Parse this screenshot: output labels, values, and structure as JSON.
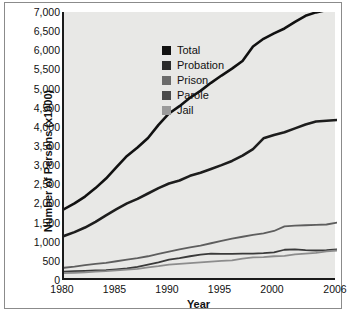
{
  "chart_data": {
    "type": "line",
    "title": "",
    "xlabel": "Year",
    "ylabel": "Number of Persons (x1000)",
    "xlim": [
      1980,
      2006
    ],
    "ylim": [
      0,
      7000
    ],
    "xticks": [
      1980,
      1985,
      1990,
      1995,
      2000,
      2006
    ],
    "xtick_labels": [
      "1980",
      "1985",
      "1990",
      "1995",
      "2000",
      "2006"
    ],
    "yticks": [
      0,
      500,
      1000,
      1500,
      2000,
      2500,
      3000,
      3500,
      4000,
      4500,
      5000,
      5500,
      6000,
      6500,
      7000
    ],
    "ytick_labels": [
      "0",
      "500",
      "1,000",
      "1,500",
      "2,000",
      "2,500",
      "3,000",
      "3,500",
      "4,000",
      "4,500",
      "5,000",
      "5,500",
      "6,000",
      "6,500",
      "7,000"
    ],
    "grid": false,
    "legend_position": "upper-left-inside",
    "x": [
      1980,
      1981,
      1982,
      1983,
      1984,
      1985,
      1986,
      1987,
      1988,
      1989,
      1990,
      1991,
      1992,
      1993,
      1994,
      1995,
      1996,
      1997,
      1998,
      1999,
      2000,
      2001,
      2002,
      2003,
      2004,
      2005,
      2006
    ],
    "series": [
      {
        "name": "Total",
        "color": "#111111",
        "values": [
          1850,
          2000,
          2180,
          2400,
          2650,
          2950,
          3240,
          3460,
          3710,
          4050,
          4350,
          4540,
          4760,
          4940,
          5150,
          5340,
          5520,
          5720,
          6100,
          6300,
          6440,
          6570,
          6740,
          6900,
          6990,
          7050,
          7100
        ]
      },
      {
        "name": "Probation",
        "color": "#1d1d1d",
        "values": [
          1150,
          1250,
          1370,
          1520,
          1690,
          1850,
          2000,
          2120,
          2260,
          2400,
          2520,
          2600,
          2720,
          2800,
          2900,
          3000,
          3110,
          3250,
          3420,
          3700,
          3790,
          3860,
          3960,
          4060,
          4140,
          4160,
          4180
        ]
      },
      {
        "name": "Prison",
        "color": "#5e5e5e",
        "values": [
          320,
          350,
          390,
          420,
          450,
          490,
          530,
          570,
          620,
          680,
          740,
          800,
          850,
          900,
          960,
          1020,
          1080,
          1130,
          1180,
          1220,
          1280,
          1400,
          1420,
          1430,
          1440,
          1450,
          1500
        ]
      },
      {
        "name": "Parole",
        "color": "#3a3a3a",
        "values": [
          220,
          230,
          240,
          250,
          260,
          280,
          300,
          340,
          400,
          460,
          530,
          570,
          620,
          660,
          690,
          680,
          680,
          690,
          690,
          700,
          720,
          790,
          800,
          780,
          770,
          780,
          800
        ]
      },
      {
        "name": "Jail",
        "color": "#8c8c8c",
        "values": [
          180,
          190,
          200,
          220,
          230,
          250,
          270,
          290,
          330,
          360,
          400,
          420,
          440,
          460,
          480,
          500,
          510,
          560,
          590,
          600,
          620,
          630,
          670,
          690,
          710,
          750,
          770
        ]
      }
    ]
  },
  "legend": {
    "items": [
      {
        "label": "Total",
        "color": "#111111"
      },
      {
        "label": "Probation",
        "color": "#2b2b2b"
      },
      {
        "label": "Prison",
        "color": "#6b6b6b"
      },
      {
        "label": "Parole",
        "color": "#4a4a4a"
      },
      {
        "label": "Jail",
        "color": "#9a9a9a"
      }
    ]
  }
}
